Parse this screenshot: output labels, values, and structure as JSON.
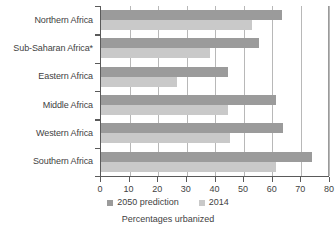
{
  "chart_data": {
    "type": "bar",
    "orientation": "horizontal",
    "title": "",
    "xlabel": "Percentages urbanized",
    "ylabel": "",
    "xlim": [
      0,
      80
    ],
    "xticks": [
      0,
      10,
      20,
      30,
      40,
      50,
      60,
      70,
      80
    ],
    "xticklabels": [
      "0",
      "10",
      "20",
      "30",
      "40",
      "50",
      "60",
      "70",
      "80"
    ],
    "grid": true,
    "grid_axis": "x",
    "legend_position": "bottom",
    "categories": [
      "Northern Africa",
      "Sub-Saharan Africa*",
      "Eastern Africa",
      "Middle Africa",
      "Western Africa",
      "Southern Africa"
    ],
    "series": [
      {
        "name": "2050 prediction",
        "color": "#9b9b9b",
        "values": [
          63.4,
          55.5,
          44.7,
          61.4,
          63.7,
          73.9
        ]
      },
      {
        "name": "2014",
        "color": "#c9c9c9",
        "values": [
          53.0,
          38.2,
          26.6,
          44.7,
          45.1,
          61.3
        ]
      }
    ]
  },
  "legend": {
    "items": [
      {
        "label": "2050 prediction",
        "swatch": "pred"
      },
      {
        "label": "2014",
        "swatch": "cur"
      }
    ]
  },
  "axis_title": "Percentages urbanized",
  "colors": {
    "prediction": "#9b9b9b",
    "current": "#c9c9c9",
    "axis": "#5a5a5a",
    "grid": "#b8b8b8",
    "text": "#3f3f3f"
  }
}
